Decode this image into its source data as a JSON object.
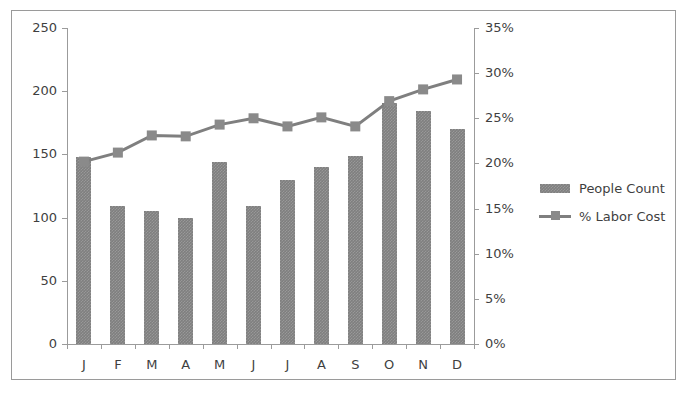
{
  "chart_data": {
    "type": "bar",
    "title": "",
    "subtitle": "",
    "xlabel": "",
    "ylabel": "",
    "grid": false,
    "legend_position": "right",
    "categories": [
      "J",
      "F",
      "M",
      "A",
      "M",
      "J",
      "J",
      "A",
      "S",
      "O",
      "N",
      "D"
    ],
    "axes": {
      "left": {
        "label": "",
        "ylim": [
          0,
          250
        ],
        "ticks": [
          0,
          50,
          100,
          150,
          200,
          250
        ],
        "tick_labels": [
          "0",
          "50",
          "100",
          "150",
          "200",
          "250"
        ]
      },
      "right": {
        "label": "",
        "ylim": [
          0,
          35
        ],
        "ticks": [
          0,
          5,
          10,
          15,
          20,
          25,
          30,
          35
        ],
        "tick_labels": [
          "0%",
          "5%",
          "10%",
          "15%",
          "20%",
          "25%",
          "30%",
          "35%"
        ]
      }
    },
    "series": [
      {
        "name": "People Count",
        "type": "bar",
        "axis": "left",
        "color": "#7f7f7f",
        "values": [
          148,
          109,
          105,
          100,
          144,
          109,
          130,
          140,
          149,
          191,
          184,
          170
        ]
      },
      {
        "name": "% Labor Cost",
        "type": "line",
        "axis": "right",
        "color": "#7f7f7f",
        "marker": "square",
        "values": [
          20.2,
          21.2,
          23.1,
          23.0,
          24.3,
          25.0,
          24.1,
          25.1,
          24.1,
          26.9,
          28.2,
          29.3
        ]
      }
    ]
  },
  "legend": {
    "items": [
      {
        "label": "People Count",
        "key": "bar-swatch"
      },
      {
        "label": "% Labor Cost",
        "key": "line-swatch"
      }
    ]
  }
}
